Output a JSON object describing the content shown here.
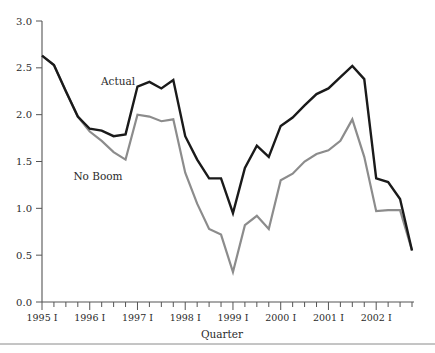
{
  "chart_data": {
    "type": "line",
    "title": "",
    "xlabel": "Quarter",
    "ylabel": "",
    "ylim": [
      0.0,
      3.0
    ],
    "ytick_values": [
      0.0,
      0.5,
      1.0,
      1.5,
      2.0,
      2.5,
      3.0
    ],
    "ytick_labels": [
      "0.0",
      "0.5",
      "1.0",
      "1.5",
      "2.0",
      "2.5",
      "3.0"
    ],
    "grid": false,
    "legend_position": "inline-annotation",
    "x": [
      "1995 I",
      "1995 II",
      "1995 III",
      "1995 IV",
      "1996 I",
      "1996 II",
      "1996 III",
      "1996 IV",
      "1997 I",
      "1997 II",
      "1997 III",
      "1997 IV",
      "1998 I",
      "1998 II",
      "1998 III",
      "1998 IV",
      "1999 I",
      "1999 II",
      "1999 III",
      "1999 IV",
      "2000 I",
      "2000 II",
      "2000 III",
      "2000 IV",
      "2001 I",
      "2001 II",
      "2001 III",
      "2001 IV",
      "2002 I",
      "2002 II",
      "2002 III",
      "2002 IV"
    ],
    "xtick_labels": [
      "1995 I",
      "1996 I",
      "1997 I",
      "1998 I",
      "1999 I",
      "2000 I",
      "2001 I",
      "2002 I"
    ],
    "xtick_major_indices": [
      0,
      4,
      8,
      12,
      16,
      20,
      24,
      28
    ],
    "series": [
      {
        "name": "Actual",
        "color": "#1a1a1a",
        "label_x": 118,
        "label_y": 85,
        "values": [
          2.63,
          2.53,
          2.25,
          1.98,
          1.85,
          1.83,
          1.77,
          1.79,
          2.3,
          2.35,
          2.28,
          2.37,
          1.77,
          1.52,
          1.32,
          1.32,
          0.95,
          1.43,
          1.67,
          1.55,
          1.88,
          1.97,
          2.1,
          2.22,
          2.28,
          2.4,
          2.52,
          2.38,
          1.32,
          1.28,
          1.1,
          0.55
        ]
      },
      {
        "name": "No Boom",
        "color": "#8c8c8c",
        "label_x": 98,
        "label_y": 180,
        "values": [
          2.63,
          2.53,
          2.25,
          1.98,
          1.82,
          1.72,
          1.6,
          1.52,
          2.0,
          1.98,
          1.93,
          1.95,
          1.38,
          1.05,
          0.78,
          0.72,
          0.32,
          0.82,
          0.92,
          0.78,
          1.3,
          1.37,
          1.5,
          1.58,
          1.62,
          1.72,
          1.95,
          1.55,
          0.97,
          0.98,
          0.98,
          0.55
        ]
      }
    ]
  },
  "axis": {
    "x_label": "Quarter",
    "y_min_label": "0.0",
    "y_max_label": "3.0"
  },
  "annotations": {
    "actual_label": "Actual",
    "no_boom_label": "No Boom"
  },
  "colors": {
    "actual": "#1a1a1a",
    "no_boom": "#8c8c8c",
    "axis": "#555555",
    "text": "#2b2b2b",
    "background": "#ffffff",
    "rule": "#8a8a8a"
  }
}
